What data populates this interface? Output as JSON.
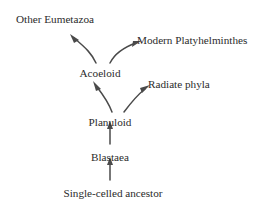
{
  "diagram": {
    "background_color": "#ffffff",
    "text_color": "#2b2b2b",
    "arrow_color": "#4a4a4a",
    "nodes": [
      {
        "id": "other-eumetazoa",
        "label": "Other Eumetazoa",
        "x": 16,
        "y": 14,
        "align": "left"
      },
      {
        "id": "modern-platyhelminthes",
        "label": "Modern Platyhelminthes",
        "x": 137,
        "y": 35,
        "align": "left"
      },
      {
        "id": "acoeloid",
        "label": "Acoeloid",
        "x": 100,
        "y": 68,
        "align": "center"
      },
      {
        "id": "radiate-phyla",
        "label": "Radiate phyla",
        "x": 148,
        "y": 79,
        "align": "left"
      },
      {
        "id": "planuloid",
        "label": "Planuloid",
        "x": 110,
        "y": 117,
        "align": "center"
      },
      {
        "id": "blastaea",
        "label": "Blastaea",
        "x": 110,
        "y": 152,
        "align": "center"
      },
      {
        "id": "single-celled-ancestor",
        "label": "Single-celled ancestor",
        "x": 113,
        "y": 188,
        "align": "center"
      }
    ],
    "edges": [
      {
        "id": "acoeloid-to-other-eumetazoa",
        "from": "acoeloid",
        "to": "other-eumetazoa",
        "style": "curved"
      },
      {
        "id": "acoeloid-to-modern-platyhelminthes",
        "from": "acoeloid",
        "to": "modern-platyhelminthes",
        "style": "curved"
      },
      {
        "id": "planuloid-to-acoeloid",
        "from": "planuloid",
        "to": "acoeloid",
        "style": "curved"
      },
      {
        "id": "planuloid-to-radiate-phyla",
        "from": "planuloid",
        "to": "radiate-phyla",
        "style": "curved"
      },
      {
        "id": "blastaea-to-planuloid",
        "from": "blastaea",
        "to": "planuloid",
        "style": "straight"
      },
      {
        "id": "ancestor-to-blastaea",
        "from": "single-celled-ancestor",
        "to": "blastaea",
        "style": "straight"
      }
    ]
  }
}
